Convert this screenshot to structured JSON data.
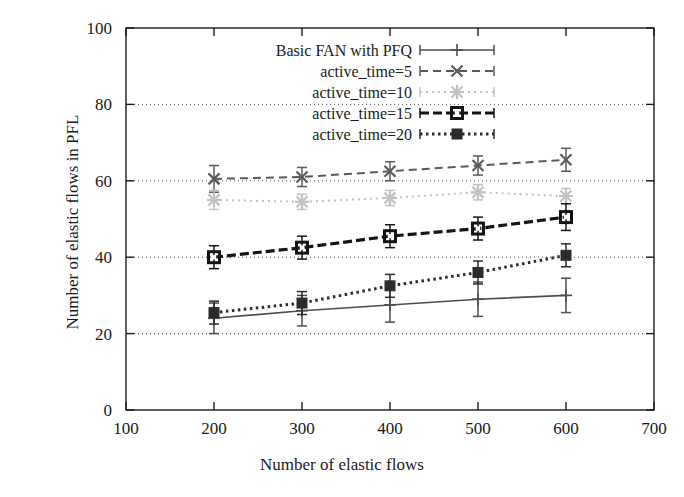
{
  "chart_data": {
    "type": "line",
    "title": "",
    "xlabel": "Number of elastic flows",
    "ylabel": "Number of elastic flows in PFL",
    "xlim": [
      100,
      700
    ],
    "ylim": [
      0,
      100
    ],
    "xticks": [
      100,
      200,
      300,
      400,
      500,
      600,
      700
    ],
    "yticks": [
      0,
      20,
      40,
      60,
      80,
      100
    ],
    "grid": true,
    "grid_axis": "y",
    "legend_position": "top-left-inside",
    "x": [
      200,
      300,
      400,
      500,
      600
    ],
    "series": [
      {
        "name": "Basic FAN with PFQ",
        "values": [
          24,
          26,
          27.5,
          29,
          30
        ],
        "errors": [
          4,
          4,
          4.5,
          4.5,
          4.5
        ],
        "color": "#4d4d4d",
        "dash": "none",
        "width": 1.6,
        "marker": "plus"
      },
      {
        "name": "active_time=5",
        "values": [
          60.5,
          61,
          62.5,
          64,
          65.5
        ],
        "errors": [
          3.5,
          2.5,
          2.5,
          2.5,
          3
        ],
        "color": "#5a5a5a",
        "dash": "8,5",
        "width": 2,
        "marker": "cross"
      },
      {
        "name": "active_time=10",
        "values": [
          55,
          54.5,
          55.5,
          57,
          56
        ],
        "errors": [
          2.5,
          2,
          2,
          2,
          2
        ],
        "color": "#c2c2c2",
        "dash": "2,4",
        "width": 2,
        "marker": "star"
      },
      {
        "name": "active_time=15",
        "values": [
          40,
          42.5,
          45.5,
          47.5,
          50.5
        ],
        "errors": [
          3,
          3,
          3,
          3,
          3.5
        ],
        "color": "#141414",
        "dash": "9,4",
        "width": 3.2,
        "marker": "open-square"
      },
      {
        "name": "active_time=20",
        "values": [
          25.5,
          28,
          32.5,
          36,
          40.5
        ],
        "errors": [
          3,
          3,
          3,
          3,
          3
        ],
        "color": "#2b2b2b",
        "dash": "2.5,3.5",
        "width": 3,
        "marker": "filled-square"
      }
    ],
    "legend_entries": [
      "Basic FAN with PFQ",
      "active_time=5",
      "active_time=10",
      "active_time=15",
      "active_time=20"
    ]
  },
  "axis": {
    "frame_color": "#1a1a1a",
    "grid_color": "#555555"
  }
}
